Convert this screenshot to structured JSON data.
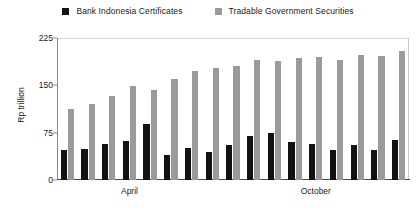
{
  "chart_data": {
    "type": "bar",
    "title": "",
    "xlabel": "",
    "ylabel": "Rp trillion",
    "ylim": [
      0,
      225
    ],
    "yticks": [
      0,
      75,
      150,
      225
    ],
    "grid": false,
    "legend_position": "top-center",
    "categories": [
      "1",
      "2",
      "3",
      "April",
      "5",
      "6",
      "7",
      "8",
      "9",
      "10",
      "11",
      "12",
      "October",
      "14",
      "15",
      "16",
      "17"
    ],
    "x_axis_labels": [
      {
        "label": "April",
        "index": 3
      },
      {
        "label": "October",
        "index": 12
      }
    ],
    "series": [
      {
        "name": "Bank Indonesia Certificates",
        "color": "#121212",
        "values": [
          47,
          49,
          57,
          62,
          88,
          40,
          51,
          44,
          56,
          69,
          74,
          60,
          57,
          47,
          55,
          48,
          63
        ]
      },
      {
        "name": "Tradable Government Securities",
        "color": "#9a9a9a",
        "values": [
          112,
          120,
          133,
          149,
          143,
          160,
          172,
          178,
          181,
          190,
          189,
          193,
          195,
          190,
          198,
          197,
          205
        ]
      }
    ]
  },
  "legend": {
    "entries": [
      {
        "label": "Bank Indonesia Certificates",
        "color": "#121212"
      },
      {
        "label": "Tradable Government Securities",
        "color": "#9a9a9a"
      }
    ]
  },
  "axes": {
    "y_title": "Rp trillion",
    "y_tick_labels": [
      "225",
      "150",
      "75",
      "0"
    ],
    "x_tick_labels": [
      "April",
      "October"
    ]
  }
}
